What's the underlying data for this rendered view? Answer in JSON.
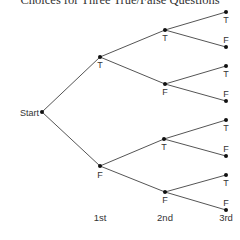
{
  "title": "Choices for Three True/False Questions",
  "start_label": "Start",
  "levels": [
    "1st",
    "2nd",
    "3rd"
  ],
  "nodes": {
    "start": {
      "x": 42,
      "y": 112
    },
    "l1": [
      {
        "label": "T",
        "x": 100,
        "y": 57,
        "lx": 100,
        "ly": 68
      },
      {
        "label": "F",
        "x": 100,
        "y": 166,
        "lx": 100,
        "ly": 178
      }
    ],
    "l2": [
      {
        "label": "T",
        "x": 165,
        "y": 30,
        "lx": 165,
        "ly": 41,
        "parent": 0
      },
      {
        "label": "F",
        "x": 165,
        "y": 84,
        "lx": 165,
        "ly": 95,
        "parent": 0
      },
      {
        "label": "T",
        "x": 164,
        "y": 139,
        "lx": 164,
        "ly": 150,
        "parent": 1
      },
      {
        "label": "F",
        "x": 165,
        "y": 192,
        "lx": 165,
        "ly": 203,
        "parent": 1
      }
    ],
    "l3": [
      {
        "label": "T",
        "x": 226,
        "y": 12,
        "lx": 226,
        "ly": 23,
        "parent": 0
      },
      {
        "label": "F",
        "x": 226,
        "y": 47,
        "lx": 226,
        "ly": 43,
        "parent": 0
      },
      {
        "label": "T",
        "x": 226,
        "y": 66,
        "lx": 226,
        "ly": 77,
        "parent": 1
      },
      {
        "label": "F",
        "x": 226,
        "y": 101,
        "lx": 226,
        "ly": 97,
        "parent": 1
      },
      {
        "label": "T",
        "x": 226,
        "y": 120,
        "lx": 226,
        "ly": 131,
        "parent": 2
      },
      {
        "label": "F",
        "x": 226,
        "y": 156,
        "lx": 226,
        "ly": 152,
        "parent": 2
      },
      {
        "label": "T",
        "x": 226,
        "y": 175,
        "lx": 226,
        "ly": 186,
        "parent": 3
      },
      {
        "label": "F",
        "x": 226,
        "y": 210,
        "lx": 226,
        "ly": 206,
        "parent": 3
      }
    ]
  },
  "axis_positions": [
    100,
    165,
    226
  ],
  "axis_y": 221
}
